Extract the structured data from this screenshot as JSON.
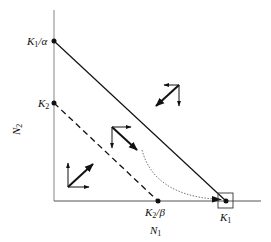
{
  "diagram": {
    "type": "phase-plane",
    "axes": {
      "x_label": "N",
      "x_label_sub": "1",
      "y_label": "N",
      "y_label_sub": "2",
      "color": "#9a9a9a"
    },
    "points": {
      "k1_over_alpha": {
        "label": "K",
        "sub": "1",
        "suffix": "/α"
      },
      "k2": {
        "label": "K",
        "sub": "2",
        "suffix": ""
      },
      "k2_over_beta": {
        "label": "K",
        "sub": "2",
        "suffix": "/β"
      },
      "k1": {
        "label": "K",
        "sub": "1",
        "suffix": ""
      }
    },
    "lines": {
      "n1_nullcline": "solid line from K1/α to K1",
      "n2_nullcline": "dashed line from K2 to K2/β",
      "trajectory": "dotted curve to K1"
    },
    "vector_groups": [
      {
        "region": "above both nullclines",
        "direction": "down-left"
      },
      {
        "region": "between nullclines",
        "direction": "down-right"
      },
      {
        "region": "below both nullclines",
        "direction": "up-right"
      }
    ],
    "stable_point_marker": "square box around K1"
  }
}
